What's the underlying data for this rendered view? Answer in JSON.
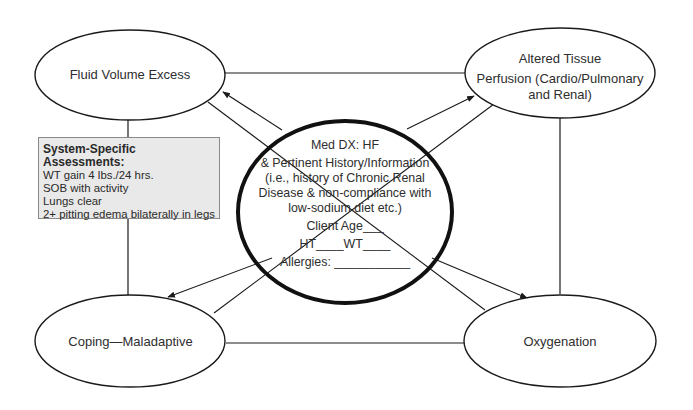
{
  "diagram": {
    "type": "concept-map",
    "center": {
      "title": "Med DX: HF",
      "lines": [
        "& Pertinent History/Information",
        "(i.e., history of Chronic Renal",
        "Disease & non-compliance with",
        "low-sodium diet etc.)"
      ],
      "client_age": "Client Age___",
      "ht_wt": "HT____WT____",
      "allergies": "Allergies: ___________"
    },
    "nodes": {
      "top_left": {
        "label": "Fluid Volume Excess"
      },
      "top_right": {
        "line1": "Altered Tissue",
        "line2": "Perfusion (Cardio/Pulmonary",
        "line3": "and Renal)"
      },
      "bottom_left": {
        "label": "Coping—Maladaptive"
      },
      "bottom_right": {
        "label": "Oxygenation"
      }
    },
    "assessment_box": {
      "title": "System-Specific Assessments:",
      "items": [
        "WT gain 4 lbs./24 hrs.",
        "SOB with activity",
        "Lungs clear",
        "2+ pitting edema bilaterally in legs"
      ]
    },
    "colors": {
      "stroke": "#1a1a1a",
      "box_fill": "#e9e9e9",
      "background": "#ffffff"
    }
  }
}
